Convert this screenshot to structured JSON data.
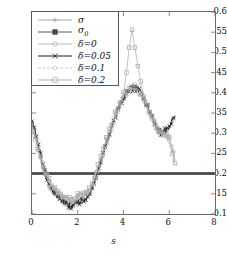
{
  "chart_data": {
    "type": "line",
    "title": "",
    "xlabel": "s",
    "ylabel": "",
    "xlim": [
      0,
      8
    ],
    "ylim": [
      0.1,
      0.6
    ],
    "xticks": [
      0,
      2,
      4,
      6,
      8
    ],
    "yticks": [
      0.1,
      0.15,
      0.2,
      0.25,
      0.3,
      0.35,
      0.4,
      0.45,
      0.5,
      0.55,
      0.6
    ],
    "xtick_labels": [
      "0",
      "2",
      "4",
      "6",
      "8"
    ],
    "ytick_labels": [
      "0.1",
      "0.15",
      "0.2",
      "0.25",
      "0.3",
      "0.35",
      "0.4",
      "0.45",
      "0.5",
      "0.55",
      "0.6"
    ],
    "grid": false,
    "legend_position": "upper-left",
    "legend_entries": [
      {
        "label": "σ",
        "marker": "plus",
        "color": "#9a9a9a",
        "linestyle": "solid",
        "sub": ""
      },
      {
        "label": "σ",
        "marker": "fsquare",
        "color": "#4a4a4a",
        "linestyle": "solid",
        "sub": "0"
      },
      {
        "label": "δ=0",
        "marker": "circle",
        "color": "#b4b4b4",
        "linestyle": "solid",
        "sub": ""
      },
      {
        "label": "δ=0.05",
        "marker": "cross",
        "color": "#1c1c1c",
        "linestyle": "solid",
        "sub": ""
      },
      {
        "label": "δ=0.1",
        "marker": "diamond",
        "color": "#c0c0c0",
        "linestyle": "dashed",
        "sub": ""
      },
      {
        "label": "δ=0.2",
        "marker": "square",
        "color": "#a8a8a8",
        "linestyle": "solid",
        "sub": ""
      }
    ],
    "series": [
      {
        "name": "σ",
        "marker": "plus",
        "color": "#9a9a9a",
        "x": [
          0.0,
          0.13,
          0.25,
          0.38,
          0.5,
          0.63,
          0.75,
          0.88,
          1.0,
          1.13,
          1.25,
          1.38,
          1.5,
          1.63,
          1.75,
          1.88,
          2.0,
          2.13,
          2.25,
          2.38,
          2.5,
          2.63,
          2.75,
          2.88,
          3.0,
          3.13,
          3.25,
          3.38,
          3.5,
          3.63,
          3.75,
          3.88,
          4.0,
          4.13,
          4.25,
          4.38,
          4.5,
          4.63,
          4.75,
          4.88,
          5.0,
          5.13,
          5.25,
          5.38,
          5.5,
          5.63,
          5.75,
          5.88,
          6.0,
          6.13,
          6.25
        ],
        "y": [
          0.325,
          0.3,
          0.27,
          0.24,
          0.212,
          0.19,
          0.172,
          0.158,
          0.15,
          0.143,
          0.138,
          0.132,
          0.126,
          0.124,
          0.122,
          0.126,
          0.13,
          0.132,
          0.134,
          0.14,
          0.152,
          0.168,
          0.186,
          0.205,
          0.228,
          0.25,
          0.272,
          0.295,
          0.318,
          0.338,
          0.356,
          0.372,
          0.388,
          0.398,
          0.406,
          0.41,
          0.41,
          0.406,
          0.398,
          0.386,
          0.37,
          0.352,
          0.336,
          0.322,
          0.31,
          0.302,
          0.3,
          0.305,
          0.318,
          0.33,
          0.338
        ]
      },
      {
        "name": "σ_0",
        "marker": "fsquare",
        "color": "#4a4a4a",
        "x": [
          0.0,
          8.0
        ],
        "y": [
          0.2,
          0.2
        ],
        "constant": 0.2
      },
      {
        "name": "δ=0",
        "marker": "circle",
        "color": "#b4b4b4",
        "x": [
          0.0,
          0.13,
          0.25,
          0.38,
          0.5,
          0.63,
          0.75,
          0.88,
          1.0,
          1.13,
          1.25,
          1.38,
          1.5,
          1.63,
          1.75,
          1.88,
          2.0,
          2.13,
          2.25,
          2.38,
          2.5,
          2.63,
          2.75,
          2.88,
          3.0,
          3.13,
          3.25,
          3.38,
          3.5,
          3.63,
          3.75,
          3.88,
          4.0,
          4.13,
          4.25,
          4.38,
          4.5,
          4.63,
          4.75,
          4.88,
          5.0,
          5.13,
          5.25,
          5.38,
          5.5,
          5.63,
          5.75,
          5.88,
          6.0,
          6.13,
          6.25
        ],
        "y": [
          0.33,
          0.302,
          0.272,
          0.243,
          0.215,
          0.193,
          0.176,
          0.164,
          0.158,
          0.152,
          0.146,
          0.138,
          0.13,
          0.126,
          0.124,
          0.128,
          0.133,
          0.136,
          0.138,
          0.144,
          0.156,
          0.172,
          0.19,
          0.21,
          0.232,
          0.254,
          0.276,
          0.298,
          0.32,
          0.34,
          0.358,
          0.374,
          0.39,
          0.4,
          0.408,
          0.412,
          0.412,
          0.408,
          0.4,
          0.388,
          0.372,
          0.354,
          0.338,
          0.324,
          0.312,
          0.304,
          0.302,
          0.3,
          0.29,
          0.262,
          0.232
        ]
      },
      {
        "name": "δ=0.05",
        "marker": "cross",
        "color": "#1c1c1c",
        "x": [
          0.0,
          0.13,
          0.25,
          0.38,
          0.5,
          0.63,
          0.75,
          0.88,
          1.0,
          1.13,
          1.25,
          1.38,
          1.5,
          1.63,
          1.75,
          1.88,
          2.0,
          2.13,
          2.25,
          2.38,
          2.5,
          2.63,
          2.75,
          2.88,
          3.0,
          3.13,
          3.25,
          3.38,
          3.5,
          3.63,
          3.75,
          3.88,
          4.0,
          4.13,
          4.25,
          4.38,
          4.5,
          4.63,
          4.75,
          4.88,
          5.0,
          5.13,
          5.25,
          5.38,
          5.5,
          5.63,
          5.75,
          5.88,
          6.0,
          6.13,
          6.25
        ],
        "y": [
          0.338,
          0.308,
          0.276,
          0.244,
          0.214,
          0.191,
          0.173,
          0.16,
          0.152,
          0.145,
          0.139,
          0.132,
          0.125,
          0.122,
          0.12,
          0.124,
          0.129,
          0.131,
          0.133,
          0.139,
          0.151,
          0.167,
          0.185,
          0.205,
          0.228,
          0.251,
          0.274,
          0.297,
          0.32,
          0.34,
          0.358,
          0.374,
          0.39,
          0.4,
          0.407,
          0.411,
          0.411,
          0.407,
          0.399,
          0.387,
          0.371,
          0.353,
          0.337,
          0.323,
          0.311,
          0.303,
          0.301,
          0.307,
          0.32,
          0.332,
          0.342
        ]
      },
      {
        "name": "δ=0.1",
        "marker": "diamond",
        "color": "#c0c0c0",
        "x": [
          0.0,
          0.13,
          0.25,
          0.38,
          0.5,
          0.63,
          0.75,
          0.88,
          1.0,
          1.13,
          1.25,
          1.38,
          1.5,
          1.63,
          1.75,
          1.88,
          2.0,
          2.13,
          2.25,
          2.38,
          2.5,
          2.63,
          2.75,
          2.88,
          3.0,
          3.13,
          3.25,
          3.38,
          3.5,
          3.63,
          3.75,
          3.88,
          4.0,
          4.13,
          4.25,
          4.38,
          4.5,
          4.63,
          4.75,
          4.88,
          5.0,
          5.13,
          5.25,
          5.38,
          5.5,
          5.63,
          5.75,
          5.88,
          6.0,
          6.13,
          6.25
        ],
        "y": [
          0.318,
          0.296,
          0.268,
          0.24,
          0.214,
          0.194,
          0.178,
          0.166,
          0.16,
          0.154,
          0.148,
          0.142,
          0.136,
          0.132,
          0.13,
          0.134,
          0.14,
          0.142,
          0.144,
          0.15,
          0.16,
          0.175,
          0.192,
          0.212,
          0.234,
          0.256,
          0.278,
          0.3,
          0.322,
          0.342,
          0.36,
          0.376,
          0.392,
          0.402,
          0.409,
          0.412,
          0.411,
          0.406,
          0.398,
          0.386,
          0.369,
          0.351,
          0.335,
          0.321,
          0.309,
          0.301,
          0.299,
          0.296,
          0.284,
          0.256,
          0.228
        ]
      },
      {
        "name": "δ=0.2",
        "marker": "square",
        "color": "#a8a8a8",
        "x": [
          0.0,
          0.13,
          0.25,
          0.38,
          0.5,
          0.63,
          0.75,
          0.88,
          1.0,
          1.13,
          1.25,
          1.38,
          1.5,
          1.63,
          1.75,
          1.88,
          2.0,
          2.13,
          2.25,
          2.38,
          2.5,
          2.63,
          2.75,
          2.88,
          3.0,
          3.13,
          3.25,
          3.38,
          3.5,
          3.63,
          3.75,
          3.88,
          4.0,
          4.13,
          4.25,
          4.38,
          4.5,
          4.63,
          4.75,
          4.88,
          5.0,
          5.13,
          5.25,
          5.38,
          5.5,
          5.63,
          5.75,
          5.88,
          6.0,
          6.13,
          6.25
        ],
        "y": [
          0.312,
          0.292,
          0.266,
          0.238,
          0.212,
          0.196,
          0.182,
          0.17,
          0.164,
          0.158,
          0.15,
          0.146,
          0.14,
          0.136,
          0.132,
          0.138,
          0.144,
          0.146,
          0.148,
          0.154,
          0.164,
          0.178,
          0.196,
          0.216,
          0.238,
          0.26,
          0.282,
          0.304,
          0.326,
          0.345,
          0.362,
          0.378,
          0.396,
          0.45,
          0.512,
          0.556,
          0.512,
          0.466,
          0.428,
          0.39,
          0.372,
          0.352,
          0.336,
          0.322,
          0.31,
          0.302,
          0.298,
          0.294,
          0.282,
          0.254,
          0.226
        ]
      }
    ],
    "annotations": {
      "spike_peak_x": 4.38,
      "spike_peak_y": 0.556,
      "minimum_y": 0.12,
      "minimum_x": 1.75,
      "baseline": 0.2,
      "data_x_end": 6.25
    }
  }
}
